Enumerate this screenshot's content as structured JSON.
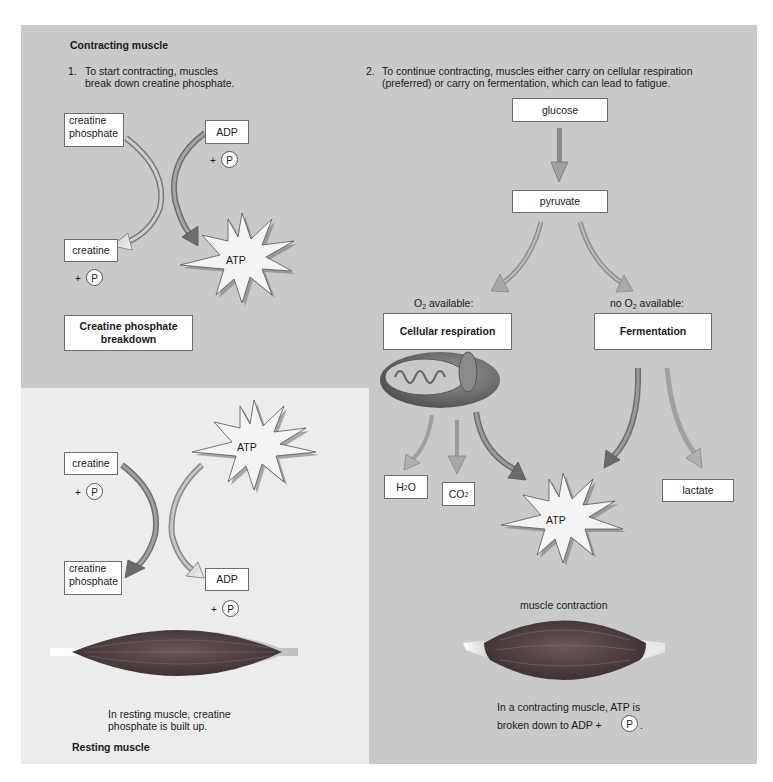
{
  "contracting": {
    "title": "Contracting muscle",
    "step1": {
      "number": "1.",
      "line1": "To start contracting, muscles",
      "line2": "break down creatine phosphate."
    },
    "step2": {
      "number": "2.",
      "line1": "To continue contracting, muscles either carry on cellular respiration",
      "line2": "(preferred) or carry on fermentation, which can lead to fatigue."
    },
    "breakdown": {
      "creatine_phosphate_line1": "creatine",
      "creatine_phosphate_line2": "phosphate",
      "adp": "ADP",
      "plus": "+",
      "p": "P",
      "creatine": "creatine",
      "atp": "ATP",
      "caption_line1": "Creatine phosphate",
      "caption_line2": "breakdown"
    },
    "pathway": {
      "glucose": "glucose",
      "pyruvate": "pyruvate",
      "o2_available_prefix": "O",
      "o2_sub": "2",
      "o2_available_suffix": " available:",
      "no_o2_prefix": "no O",
      "no_o2_suffix": " available:",
      "cellular_respiration": "Cellular respiration",
      "fermentation": "Fermentation",
      "h2o_prefix": "H",
      "h2o_sub": "2",
      "h2o_suffix": "O",
      "co2_prefix": "CO",
      "co2_sub": "2",
      "atp": "ATP",
      "lactate": "lactate",
      "muscle_contraction": "muscle contraction",
      "caption_line1": "In a contracting muscle, ATP is",
      "caption_line2": "broken down to ADP +",
      "caption_p": "P",
      "caption_end": "."
    }
  },
  "resting": {
    "title": "Resting muscle",
    "atp": "ATP",
    "creatine": "creatine",
    "plus": "+",
    "p": "P",
    "creatine_phosphate_line1": "creatine",
    "creatine_phosphate_line2": "phosphate",
    "adp": "ADP",
    "caption_line1": "In resting muscle, creatine",
    "caption_line2": "phosphate is built up."
  },
  "colors": {
    "panel_gray": "#c9c9c9",
    "resting_panel": "#ececec",
    "arrow_dark": "#7a7a7a",
    "arrow_light": "#b5b5b5",
    "muscle": "#4a3c3c"
  }
}
